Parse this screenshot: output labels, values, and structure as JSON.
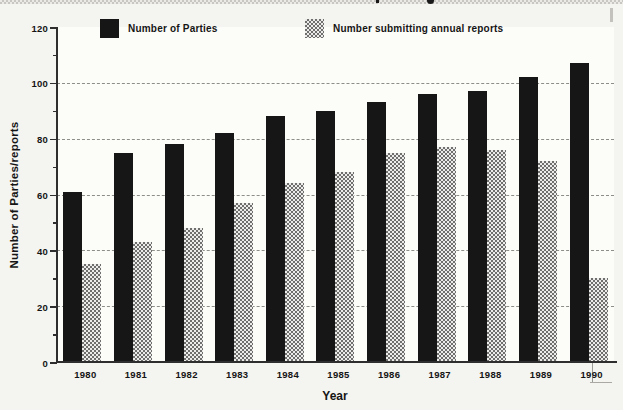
{
  "chart_data": {
    "type": "bar",
    "title": "",
    "categories": [
      "1980",
      "1981",
      "1982",
      "1983",
      "1984",
      "1985",
      "1986",
      "1987",
      "1988",
      "1989",
      "1990"
    ],
    "series": [
      {
        "name": "Number of Parties",
        "style": "solid-black",
        "color": "#161616",
        "values": [
          61,
          75,
          78,
          82,
          88,
          90,
          93,
          96,
          97,
          102,
          107
        ]
      },
      {
        "name": "Number submitting annual reports",
        "style": "checker-dither-gray",
        "color": "#b0b0ad",
        "values": [
          35,
          43,
          48,
          57,
          64,
          68,
          75,
          77,
          76,
          72,
          30
        ]
      }
    ],
    "xlabel": "Year",
    "ylabel": "Number of Parties/reports",
    "ylim": [
      0,
      120
    ],
    "yticks_major": [
      0,
      20,
      40,
      60,
      80,
      100,
      120
    ],
    "yticks_minor": [
      10,
      30,
      50,
      70,
      90,
      110
    ],
    "gridlines": {
      "style": "dashed",
      "at": [
        20,
        40,
        60,
        80,
        100
      ],
      "color": "#8d8d89"
    },
    "legend_position": "top-inside",
    "legend": [
      "Number of Parties",
      "Number submitting annual reports"
    ]
  }
}
